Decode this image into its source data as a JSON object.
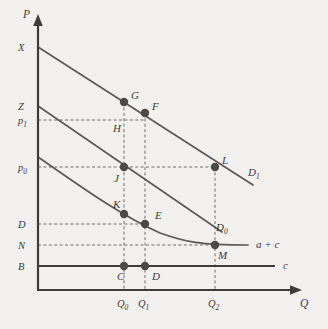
{
  "figure": {
    "background_color": "#f2f1ef",
    "line_color": "#5a5a5a",
    "axis_color": "#3d3d3d",
    "marker_color": "#4a4a4a",
    "guide_color": "#6e6e6e",
    "caption": ""
  },
  "axes": {
    "y_label": "P",
    "x_label": "Q",
    "y_ticks": [
      {
        "label": "X",
        "sub": "",
        "y": 47
      },
      {
        "label": "Z",
        "sub": "",
        "y": 106
      },
      {
        "label": "p",
        "sub": "1",
        "y": 120
      },
      {
        "label": "p",
        "sub": "0",
        "y": 167
      },
      {
        "label": "D",
        "sub": "",
        "y": 224
      },
      {
        "label": "N",
        "sub": "",
        "y": 245
      },
      {
        "label": "B",
        "sub": "",
        "y": 266
      }
    ],
    "x_ticks": [
      {
        "label": "Q",
        "sub": "0",
        "x": 124
      },
      {
        "label": "Q",
        "sub": "1",
        "x": 145
      },
      {
        "label": "Q",
        "sub": "2",
        "x": 215
      }
    ]
  },
  "curves": [
    {
      "name": "demand-curve-d1",
      "label": "D",
      "sub": "1",
      "type": "line",
      "points": "38,47 253,185",
      "label_x": 248,
      "label_y": 176
    },
    {
      "name": "demand-curve-d0",
      "label": "D",
      "sub": "0",
      "type": "line",
      "points": "38,106 222,232",
      "label_x": 216,
      "label_y": 231
    },
    {
      "name": "average-plus-marginal-cost-curve",
      "label": "a + c",
      "sub": "",
      "type": "curve",
      "path": "M 38,157 C 80,186 120,215 160,233 C 185,242 200,245 248,245",
      "label_x": 256,
      "label_y": 248
    },
    {
      "name": "marginal-cost-line",
      "label": "c",
      "sub": "",
      "type": "line",
      "points": "38,266 275,266",
      "label_x": 283,
      "label_y": 269
    }
  ],
  "points": [
    {
      "name": "point-g",
      "label": "G",
      "x": 124,
      "y": 102,
      "label_x": 131,
      "label_y": 99
    },
    {
      "name": "point-f",
      "label": "F",
      "x": 145,
      "y": 113,
      "label_x": 152,
      "label_y": 110
    },
    {
      "name": "point-h",
      "label": "H",
      "x": null,
      "y": null,
      "label_x": 113,
      "label_y": 132
    },
    {
      "name": "point-j",
      "label": "J",
      "x": 124,
      "y": 167,
      "label_x": 114,
      "label_y": 182
    },
    {
      "name": "point-l",
      "label": "L",
      "x": 215,
      "y": 167,
      "label_x": 222,
      "label_y": 164
    },
    {
      "name": "point-k",
      "label": "K",
      "x": 124,
      "y": 214,
      "label_x": 113,
      "label_y": 208
    },
    {
      "name": "point-e",
      "label": "E",
      "x": 145,
      "y": 224,
      "label_x": 155,
      "label_y": 219
    },
    {
      "name": "point-m",
      "label": "M",
      "x": 215,
      "y": 245,
      "label_x": 218,
      "label_y": 259
    },
    {
      "name": "point-c",
      "label": "C",
      "x": 124,
      "y": 266,
      "label_x": 117,
      "label_y": 280
    },
    {
      "name": "point-d",
      "label": "D",
      "x": 145,
      "y": 266,
      "label_x": 152,
      "label_y": 280
    }
  ],
  "guides": [
    {
      "name": "guide-p1-horizontal",
      "x1": 38,
      "y1": 120,
      "x2": 145,
      "y2": 120
    },
    {
      "name": "guide-p0-horizontal",
      "x1": 38,
      "y1": 167,
      "x2": 215,
      "y2": 167
    },
    {
      "name": "guide-d-horizontal",
      "x1": 38,
      "y1": 224,
      "x2": 145,
      "y2": 224
    },
    {
      "name": "guide-n-horizontal",
      "x1": 38,
      "y1": 245,
      "x2": 215,
      "y2": 245
    },
    {
      "name": "guide-q0-vertical",
      "x1": 124,
      "y1": 102,
      "x2": 124,
      "y2": 290
    },
    {
      "name": "guide-q1-vertical",
      "x1": 145,
      "y1": 113,
      "x2": 145,
      "y2": 290
    },
    {
      "name": "guide-q2-vertical",
      "x1": 215,
      "y1": 167,
      "x2": 215,
      "y2": 290
    }
  ]
}
